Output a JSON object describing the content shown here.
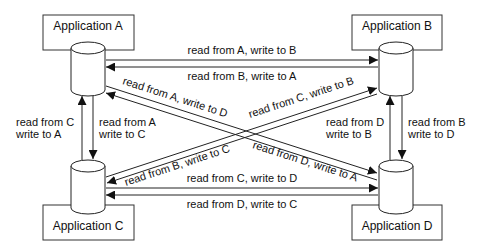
{
  "applications": [
    {
      "id": "A",
      "label": "Application A"
    },
    {
      "id": "B",
      "label": "Application B"
    },
    {
      "id": "C",
      "label": "Application C"
    },
    {
      "id": "D",
      "label": "Application D"
    }
  ],
  "flows": [
    {
      "id": "a-to-b",
      "from": "A",
      "to": "B",
      "label": "read from A, write to B"
    },
    {
      "id": "b-to-a",
      "from": "B",
      "to": "A",
      "label": "read from B, write to A"
    },
    {
      "id": "c-to-d",
      "from": "C",
      "to": "D",
      "label": "read from C, write to D"
    },
    {
      "id": "d-to-c",
      "from": "D",
      "to": "C",
      "label": "read from D, write to C"
    },
    {
      "id": "c-to-a",
      "from": "C",
      "to": "A",
      "label_line1": "read from C",
      "label_line2": "write to A"
    },
    {
      "id": "a-to-c",
      "from": "A",
      "to": "C",
      "label_line1": "read from A",
      "label_line2": "write to C"
    },
    {
      "id": "d-to-b",
      "from": "D",
      "to": "B",
      "label_line1": "read from D",
      "label_line2": "write to B"
    },
    {
      "id": "b-to-d",
      "from": "B",
      "to": "D",
      "label_line1": "read from B",
      "label_line2": "write to D"
    },
    {
      "id": "a-to-d",
      "from": "A",
      "to": "D",
      "label": "read from A, write to D"
    },
    {
      "id": "d-to-a",
      "from": "D",
      "to": "A",
      "label": "read from D, write to A"
    },
    {
      "id": "c-to-b",
      "from": "C",
      "to": "B",
      "label": "read from C, write to B"
    },
    {
      "id": "b-to-c",
      "from": "B",
      "to": "C",
      "label": "read from B, write to C"
    }
  ]
}
